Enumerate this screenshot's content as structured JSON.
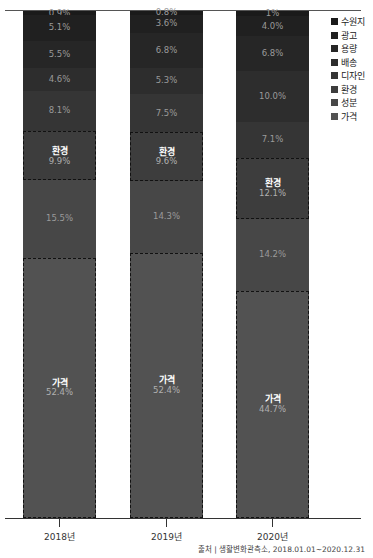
{
  "header": {
    "title_fragment": "’’"
  },
  "legend": [
    {
      "label": "수원지",
      "color": "#1a1a1a"
    },
    {
      "label": "광고",
      "color": "#202020"
    },
    {
      "label": "용량",
      "color": "#262626"
    },
    {
      "label": "배송",
      "color": "#2d2d2d"
    },
    {
      "label": "디자인",
      "color": "#353535"
    },
    {
      "label": "환경",
      "color": "#3d3d3d"
    },
    {
      "label": "성분",
      "color": "#474747"
    },
    {
      "label": "가격",
      "color": "#525252"
    }
  ],
  "bars": [
    {
      "year": "2018년",
      "segments": [
        {
          "name": "수원지",
          "text": "0.9%",
          "value": 0.9
        },
        {
          "name": "광고",
          "text": "5.1%",
          "value": 5.1
        },
        {
          "name": "용량",
          "text": "5.5%",
          "value": 5.5
        },
        {
          "name": "배송",
          "text": "4.6%",
          "value": 4.6
        },
        {
          "name": "디자인",
          "text": "8.1%",
          "value": 8.1
        },
        {
          "name": "환경",
          "text": "9.9%",
          "value": 9.9,
          "label": "환경"
        },
        {
          "name": "성분",
          "text": "15.5%",
          "value": 15.5
        },
        {
          "name": "가격",
          "text": "52.4%",
          "value": 52.4,
          "label": "가격"
        }
      ]
    },
    {
      "year": "2019년",
      "segments": [
        {
          "name": "수원지",
          "text": "0.8%",
          "value": 0.8
        },
        {
          "name": "광고",
          "text": "3.6%",
          "value": 3.6
        },
        {
          "name": "용량",
          "text": "6.8%",
          "value": 6.8
        },
        {
          "name": "배송",
          "text": "5.3%",
          "value": 5.3
        },
        {
          "name": "디자인",
          "text": "7.5%",
          "value": 7.5
        },
        {
          "name": "환경",
          "text": "9.6%",
          "value": 9.6,
          "label": "환경"
        },
        {
          "name": "성분",
          "text": "14.3%",
          "value": 14.3
        },
        {
          "name": "가격",
          "text": "52.4%",
          "value": 52.4,
          "label": "가격"
        }
      ]
    },
    {
      "year": "2020년",
      "segments": [
        {
          "name": "수원지",
          "text": "1%",
          "value": 1.0
        },
        {
          "name": "광고",
          "text": "4.0%",
          "value": 4.0
        },
        {
          "name": "용량",
          "text": "6.8%",
          "value": 6.8
        },
        {
          "name": "배송",
          "text": "10.0%",
          "value": 10.0
        },
        {
          "name": "디자인",
          "text": "7.1%",
          "value": 7.1
        },
        {
          "name": "환경",
          "text": "12.1%",
          "value": 12.1,
          "label": "환경"
        },
        {
          "name": "성분",
          "text": "14.2%",
          "value": 14.2
        },
        {
          "name": "가격",
          "text": "44.7%",
          "value": 44.7,
          "label": "가격"
        }
      ]
    }
  ],
  "footer": {
    "source": "출처 | 생활변화관측소, 2018.01.01~2020.12.31"
  },
  "chart_data": {
    "type": "bar",
    "stacked": true,
    "normalized": true,
    "categories": [
      "2018년",
      "2019년",
      "2020년"
    ],
    "series": [
      {
        "name": "수원지",
        "values": [
          0.9,
          0.8,
          1.0
        ]
      },
      {
        "name": "광고",
        "values": [
          5.1,
          3.6,
          4.0
        ]
      },
      {
        "name": "용량",
        "values": [
          5.5,
          6.8,
          6.8
        ]
      },
      {
        "name": "배송",
        "values": [
          4.6,
          5.3,
          10.0
        ]
      },
      {
        "name": "디자인",
        "values": [
          8.1,
          7.5,
          7.1
        ]
      },
      {
        "name": "환경",
        "values": [
          9.9,
          9.6,
          12.1
        ]
      },
      {
        "name": "성분",
        "values": [
          15.5,
          14.3,
          14.2
        ]
      },
      {
        "name": "가격",
        "values": [
          52.4,
          52.4,
          44.7
        ]
      }
    ],
    "highlighted_series": [
      "환경",
      "가격"
    ],
    "title": "",
    "xlabel": "",
    "ylabel": "",
    "ylim": [
      0,
      100
    ],
    "grid": false,
    "legend_position": "top-right",
    "annotations": [
      "출처 | 생활변화관측소, 2018.01.01~2020.12.31"
    ]
  }
}
